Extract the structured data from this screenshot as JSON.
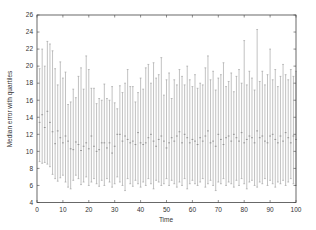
{
  "chart_data": {
    "type": "errorbar",
    "title": "",
    "xlabel": "Time",
    "ylabel": "Median error with quartiles",
    "xlim": [
      0,
      100
    ],
    "ylim": [
      4,
      26
    ],
    "xticks": [
      0,
      10,
      20,
      30,
      40,
      50,
      60,
      70,
      80,
      90,
      100
    ],
    "yticks": [
      4,
      6,
      8,
      10,
      12,
      14,
      16,
      18,
      20,
      22,
      24,
      26
    ],
    "grid": false,
    "legend": null,
    "series_color": "#999999",
    "series": [
      {
        "name": "Median error",
        "x": [
          1,
          2,
          3,
          4,
          5,
          6,
          7,
          8,
          9,
          10,
          11,
          12,
          13,
          14,
          15,
          16,
          17,
          18,
          19,
          20,
          21,
          22,
          23,
          24,
          25,
          26,
          27,
          28,
          29,
          30,
          31,
          32,
          33,
          34,
          35,
          36,
          37,
          38,
          39,
          40,
          41,
          42,
          43,
          44,
          45,
          46,
          47,
          48,
          49,
          50,
          51,
          52,
          53,
          54,
          55,
          56,
          57,
          58,
          59,
          60,
          61,
          62,
          63,
          64,
          65,
          66,
          67,
          68,
          69,
          70,
          71,
          72,
          73,
          74,
          75,
          76,
          77,
          78,
          79,
          80,
          81,
          82,
          83,
          84,
          85,
          86,
          87,
          88,
          89,
          90,
          91,
          92,
          93,
          94,
          95,
          96,
          97,
          98,
          99,
          100
        ],
        "median": [
          13.4,
          14.3,
          12.8,
          14.7,
          13.4,
          12.3,
          10.9,
          12.4,
          11.6,
          11.0,
          11.8,
          11.2,
          10.3,
          10.2,
          11.1,
          10.8,
          10.1,
          10.6,
          11.0,
          10.3,
          11.8,
          10.6,
          10.0,
          10.2,
          11.0,
          11.0,
          10.4,
          11.0,
          9.8,
          10.6,
          12.0,
          12.0,
          11.2,
          11.8,
          11.4,
          11.0,
          11.2,
          10.8,
          12.2,
          11.0,
          10.8,
          11.0,
          11.6,
          12.0,
          11.2,
          10.6,
          11.4,
          11.8,
          11.2,
          10.4,
          11.0,
          11.6,
          11.2,
          11.8,
          12.3,
          11.0,
          12.0,
          11.6,
          11.0,
          11.4,
          11.2,
          10.8,
          11.6,
          11.2,
          11.8,
          12.4,
          11.0,
          11.2,
          10.6,
          12.0,
          11.4,
          10.8,
          11.6,
          11.8,
          11.2,
          12.0,
          11.6,
          11.2,
          12.2,
          11.0,
          11.4,
          11.8,
          11.6,
          11.0,
          12.4,
          11.6,
          11.8,
          11.2,
          11.0,
          11.8,
          12.0,
          11.4,
          11.0,
          11.8,
          11.2,
          12.2,
          11.6,
          11.0,
          11.8,
          11.4
        ],
        "lower_quartile": [
          8.8,
          8.6,
          8.7,
          8.5,
          8.2,
          7.3,
          6.8,
          6.5,
          6.9,
          7.2,
          6.4,
          5.8,
          5.6,
          6.6,
          7.2,
          6.8,
          6.1,
          6.4,
          7.0,
          6.0,
          6.4,
          6.8,
          6.2,
          5.9,
          6.6,
          6.0,
          6.8,
          6.4,
          5.8,
          6.2,
          7.0,
          6.4,
          6.0,
          5.4,
          6.8,
          6.2,
          5.9,
          6.6,
          6.2,
          5.8,
          6.4,
          6.0,
          6.8,
          6.2,
          5.6,
          6.6,
          6.4,
          6.0,
          6.2,
          6.8,
          6.0,
          6.6,
          6.2,
          5.8,
          6.4,
          6.0,
          6.8,
          5.6,
          6.2,
          6.6,
          6.2,
          6.0,
          6.4,
          6.8,
          5.8,
          6.2,
          6.6,
          6.0,
          5.4,
          6.4,
          6.2,
          6.8,
          6.0,
          6.4,
          6.2,
          5.8,
          6.6,
          6.0,
          6.8,
          6.2,
          5.6,
          6.4,
          6.6,
          6.0,
          5.8,
          6.4,
          6.2,
          6.8,
          6.0,
          6.6,
          6.2,
          5.8,
          6.4,
          6.2,
          6.6,
          6.0,
          6.4,
          6.8,
          6.2,
          6.0
        ],
        "upper_quartile": [
          19.7,
          22.0,
          20.0,
          22.9,
          22.6,
          21.8,
          19.7,
          17.8,
          20.5,
          18.6,
          19.3,
          15.5,
          15.8,
          17.3,
          16.3,
          18.8,
          19.8,
          17.3,
          21.2,
          19.6,
          17.4,
          17.4,
          15.6,
          16.2,
          16.0,
          17.9,
          16.2,
          16.0,
          17.6,
          15.7,
          15.0,
          17.7,
          16.9,
          18.0,
          19.6,
          17.6,
          17.6,
          15.8,
          16.9,
          18.6,
          17.3,
          19.8,
          20.2,
          18.0,
          20.4,
          18.6,
          19.0,
          21.0,
          16.6,
          18.4,
          19.2,
          16.2,
          18.4,
          17.8,
          19.6,
          18.8,
          17.8,
          20.0,
          18.4,
          17.6,
          19.0,
          17.4,
          18.0,
          17.8,
          19.8,
          21.2,
          18.4,
          19.4,
          17.2,
          18.6,
          19.0,
          20.4,
          17.6,
          18.2,
          19.2,
          17.0,
          18.8,
          19.6,
          18.0,
          23.0,
          17.8,
          19.4,
          18.6,
          17.2,
          24.3,
          18.2,
          19.4,
          17.8,
          19.0,
          22.0,
          18.4,
          19.6,
          17.6,
          18.8,
          20.2,
          19.0,
          18.4,
          19.6,
          18.8,
          19.4
        ]
      }
    ]
  },
  "axes": {
    "xlabel": "Time",
    "ylabel": "Median error with quartiles",
    "x_tick_labels": [
      "0",
      "10",
      "20",
      "30",
      "40",
      "50",
      "60",
      "70",
      "80",
      "90",
      "100"
    ],
    "y_tick_labels": [
      "4",
      "6",
      "8",
      "10",
      "12",
      "14",
      "16",
      "18",
      "20",
      "22",
      "24",
      "26"
    ]
  }
}
